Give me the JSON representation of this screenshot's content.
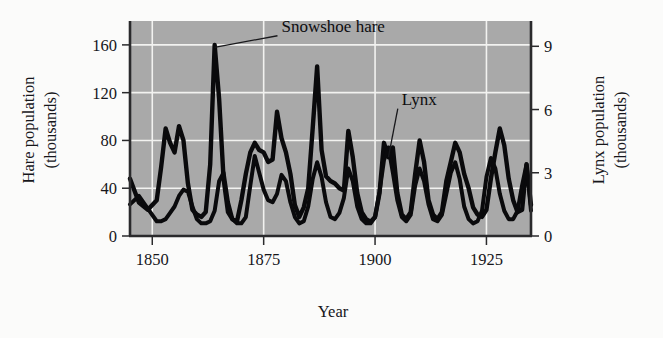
{
  "figure": {
    "background_color": "#fbfbfa",
    "plot_background_color": "#a9a9a9",
    "gridline_color": "#f2f2f0",
    "line_color": "#0a0a0c"
  },
  "chart_data": {
    "type": "line",
    "title": "",
    "xlabel": "Year",
    "ylabel": "Hare population (thousands)",
    "y2label": "Lynx population (thousands)",
    "xlim": [
      1845,
      1935
    ],
    "ylim": [
      0,
      180
    ],
    "y2lim": [
      0,
      10.2
    ],
    "xticks": [
      1850,
      1875,
      1900,
      1925
    ],
    "xtick_labels": [
      "1850",
      "1875",
      "1900",
      "1925"
    ],
    "yticks": [
      0,
      40,
      80,
      120,
      160
    ],
    "ytick_labels": [
      "0",
      "40",
      "80",
      "120",
      "160"
    ],
    "y2ticks": [
      0,
      3,
      6,
      9
    ],
    "y2tick_labels": [
      "0",
      "3",
      "6",
      "9"
    ],
    "grid": true,
    "grid_axes": "both",
    "legend": "none",
    "annotations": [
      {
        "text": "Snowshoe hare",
        "label_x": 1879,
        "label_y": 171,
        "point_x": 1864,
        "point_y": 158
      },
      {
        "text": "Lynx",
        "label_x": 1906,
        "label_y": 110,
        "point_x": 1903,
        "point_y": 66
      }
    ],
    "series": [
      {
        "name": "Snowshoe hare",
        "axis": "left",
        "units": "thousands",
        "x": [
          1845,
          1847,
          1849,
          1851,
          1852,
          1853,
          1854,
          1855,
          1856,
          1857,
          1858,
          1859,
          1860,
          1861,
          1862,
          1863,
          1864,
          1865,
          1866,
          1867,
          1868,
          1869,
          1870,
          1871,
          1872,
          1873,
          1874,
          1875,
          1876,
          1877,
          1878,
          1879,
          1880,
          1881,
          1882,
          1883,
          1884,
          1885,
          1886,
          1887,
          1888,
          1889,
          1890,
          1891,
          1892,
          1893,
          1894,
          1895,
          1896,
          1897,
          1898,
          1899,
          1900,
          1901,
          1902,
          1903,
          1904,
          1905,
          1906,
          1907,
          1908,
          1909,
          1910,
          1911,
          1912,
          1913,
          1914,
          1915,
          1916,
          1917,
          1918,
          1919,
          1920,
          1921,
          1922,
          1923,
          1924,
          1925,
          1926,
          1927,
          1928,
          1929,
          1930,
          1931,
          1932,
          1933,
          1934,
          1935
        ],
        "y": [
          48,
          28,
          22,
          30,
          58,
          90,
          78,
          70,
          92,
          80,
          44,
          22,
          18,
          16,
          20,
          60,
          160,
          115,
          48,
          20,
          14,
          12,
          30,
          52,
          70,
          78,
          72,
          70,
          62,
          64,
          104,
          82,
          70,
          52,
          26,
          16,
          24,
          40,
          90,
          142,
          72,
          50,
          46,
          44,
          40,
          38,
          88,
          66,
          36,
          20,
          14,
          12,
          16,
          36,
          78,
          66,
          74,
          36,
          18,
          14,
          20,
          52,
          80,
          62,
          30,
          18,
          14,
          20,
          46,
          62,
          78,
          70,
          52,
          40,
          24,
          18,
          16,
          22,
          48,
          70,
          90,
          76,
          48,
          30,
          20,
          22,
          60,
          26
        ]
      },
      {
        "name": "Lynx",
        "axis": "right",
        "units": "thousands",
        "x": [
          1845,
          1847,
          1849,
          1851,
          1852,
          1853,
          1854,
          1855,
          1856,
          1857,
          1858,
          1859,
          1860,
          1861,
          1862,
          1863,
          1864,
          1865,
          1866,
          1867,
          1868,
          1869,
          1870,
          1871,
          1872,
          1873,
          1874,
          1875,
          1876,
          1877,
          1878,
          1879,
          1880,
          1881,
          1882,
          1883,
          1884,
          1885,
          1886,
          1887,
          1888,
          1889,
          1890,
          1891,
          1892,
          1893,
          1894,
          1895,
          1896,
          1897,
          1898,
          1899,
          1900,
          1901,
          1902,
          1903,
          1904,
          1905,
          1906,
          1907,
          1908,
          1909,
          1910,
          1911,
          1912,
          1913,
          1914,
          1915,
          1916,
          1917,
          1918,
          1919,
          1920,
          1921,
          1922,
          1923,
          1924,
          1925,
          1926,
          1927,
          1928,
          1929,
          1930,
          1931,
          1932,
          1933,
          1934,
          1935
        ],
        "y_thousands": [
          1.5,
          1.9,
          1.3,
          0.7,
          0.7,
          0.8,
          1.1,
          1.4,
          1.9,
          2.2,
          2.1,
          1.4,
          0.8,
          0.6,
          0.6,
          0.7,
          1.2,
          2.6,
          3.0,
          1.6,
          0.8,
          0.6,
          0.6,
          0.9,
          2.4,
          3.8,
          3.0,
          2.2,
          1.7,
          1.6,
          2.0,
          2.9,
          2.6,
          1.6,
          0.9,
          0.6,
          0.7,
          1.4,
          2.7,
          3.5,
          2.8,
          1.6,
          0.9,
          0.8,
          1.1,
          1.8,
          3.2,
          2.6,
          1.4,
          0.8,
          0.6,
          0.6,
          0.9,
          2.1,
          3.6,
          4.2,
          3.0,
          1.7,
          0.9,
          0.7,
          1.0,
          2.4,
          3.2,
          2.6,
          1.5,
          0.8,
          0.7,
          1.0,
          2.0,
          3.0,
          3.5,
          2.7,
          1.4,
          0.8,
          0.6,
          0.7,
          1.2,
          2.8,
          3.7,
          3.2,
          2.0,
          1.2,
          0.8,
          0.8,
          1.2,
          2.4,
          3.4,
          1.2
        ]
      }
    ]
  }
}
